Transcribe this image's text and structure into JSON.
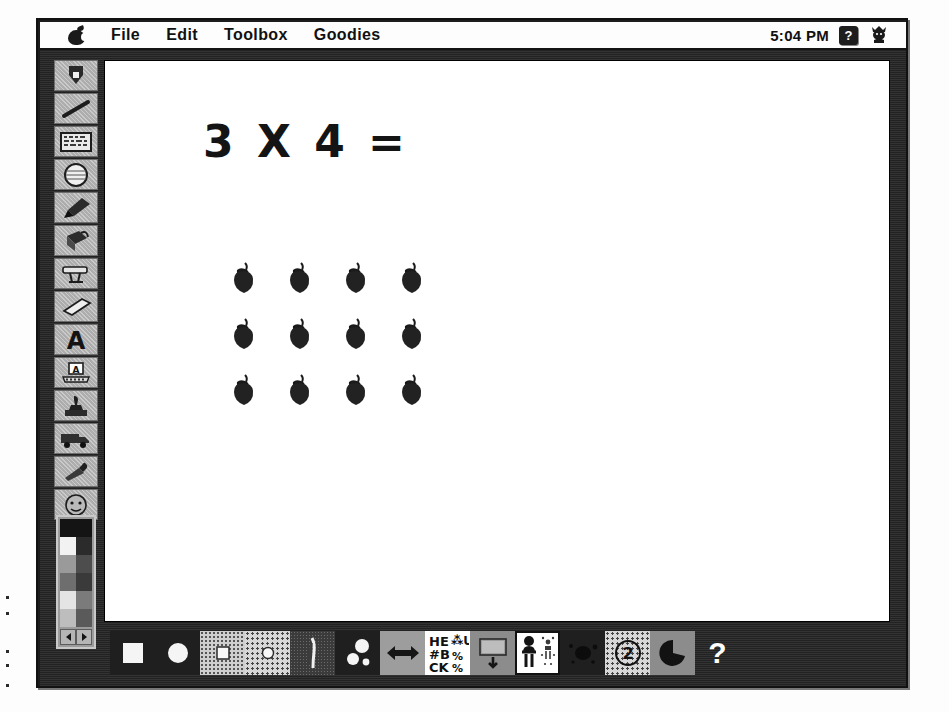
{
  "window": {
    "title": "Kid Pix paint window"
  },
  "menubar": {
    "apple_icon": "apple-logo-icon",
    "items": [
      {
        "label": "File",
        "name": "menu-file"
      },
      {
        "label": "Edit",
        "name": "menu-edit"
      },
      {
        "label": "Toolbox",
        "name": "menu-toolbox"
      },
      {
        "label": "Goodies",
        "name": "menu-goodies"
      }
    ],
    "clock": "5:04 PM",
    "help_badge": "?",
    "kid_icon": "kid-face-icon"
  },
  "tool_palette": {
    "tools": [
      {
        "name": "pencil-tool",
        "label": "Pencil"
      },
      {
        "name": "line-tool",
        "label": "Line"
      },
      {
        "name": "rectangle-tool",
        "label": "Rectangle"
      },
      {
        "name": "oval-tool",
        "label": "Oval"
      },
      {
        "name": "brush-tool",
        "label": "Wacky Brush"
      },
      {
        "name": "paint-can-tool",
        "label": "Fill"
      },
      {
        "name": "eraser-block-tool",
        "label": "Electric Mixer"
      },
      {
        "name": "eraser-tool",
        "label": "Eraser"
      },
      {
        "name": "text-tool",
        "label": "Alphabet Text"
      },
      {
        "name": "typewriter-tool",
        "label": "Rubber Stamp Text"
      },
      {
        "name": "stamp-tool",
        "label": "Rubber Stamps"
      },
      {
        "name": "truck-tool",
        "label": "Moving Van"
      },
      {
        "name": "eyedropper-tool",
        "label": "Pick Color"
      },
      {
        "name": "face-tool",
        "label": "Undo Guy"
      }
    ]
  },
  "swatches": {
    "colors": [
      "#141414",
      "#141414",
      "#f2f2f2",
      "#2b2b2b",
      "#9a9a9a",
      "#4d4d4d",
      "#6e6e6e",
      "#3a3a3a",
      "#e4e4e4",
      "#7b7b7b",
      "#bdbdbd",
      "#5a5a5a"
    ],
    "prev_label": "◀",
    "next_label": "▶"
  },
  "canvas": {
    "equation": "3 X 4 =",
    "stamp_icon": "strawberry-icon",
    "stamp_rows": 3,
    "stamp_cols": 4,
    "stamp_total": 12
  },
  "option_bar": {
    "options": [
      {
        "name": "option-large-square",
        "icon": "large-square-icon",
        "bg": "bg-dark"
      },
      {
        "name": "option-large-circle",
        "icon": "large-circle-icon",
        "bg": "bg-dark"
      },
      {
        "name": "option-small-square",
        "icon": "small-square-icon",
        "bg": "bg-dot-light"
      },
      {
        "name": "option-small-circle",
        "icon": "small-circle-icon",
        "bg": "bg-dot-dense"
      },
      {
        "name": "option-spray-brush",
        "icon": "spray-brush-icon",
        "bg": "bg-noise"
      },
      {
        "name": "option-bubbles",
        "icon": "bubbles-icon",
        "bg": "bg-dark"
      },
      {
        "name": "option-resize-arrows",
        "icon": "double-arrow-icon",
        "bg": "bg-gray"
      },
      {
        "name": "option-letters",
        "icon": "letters-block-icon",
        "bg": "bg-white"
      },
      {
        "name": "option-stamp-pad",
        "icon": "stamp-pad-down-arrow-icon",
        "bg": "bg-midgray"
      },
      {
        "name": "option-people-stamps",
        "icon": "stick-figures-icon",
        "bg": "bg-white",
        "selected": true
      },
      {
        "name": "option-splat",
        "icon": "splat-icon",
        "bg": "bg-dark"
      },
      {
        "name": "option-page-two",
        "icon": "circled-two-icon",
        "bg": "bg-dot-dense",
        "value": "2"
      },
      {
        "name": "option-pie",
        "icon": "pie-wedge-icon",
        "bg": "bg-midgray"
      }
    ],
    "help_label": "?"
  }
}
